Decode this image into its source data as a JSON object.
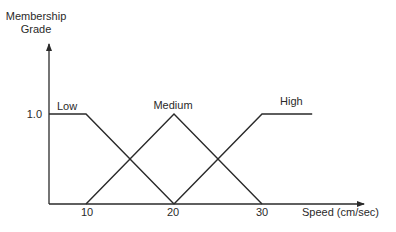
{
  "chart_data": {
    "type": "line",
    "title": "",
    "ylabel_line1": "Membership",
    "ylabel_line2": "Grade",
    "xlabel": "Speed (cm/sec)",
    "ytick_labels": [
      "1.0"
    ],
    "xtick_labels": [
      "10",
      "20",
      "30"
    ],
    "xticks": [
      10,
      20,
      30
    ],
    "yticks": [
      1.0
    ],
    "ylim": [
      0,
      1.5
    ],
    "xlim": [
      4,
      37
    ],
    "grid": false,
    "legend": "inline labels",
    "series": [
      {
        "name": "Low",
        "x": [
          5.8,
          10,
          20
        ],
        "y": [
          1,
          1,
          0
        ]
      },
      {
        "name": "Medium",
        "x": [
          10,
          20,
          30
        ],
        "y": [
          0,
          1,
          0
        ]
      },
      {
        "name": "High",
        "x": [
          20,
          30,
          35.7
        ],
        "y": [
          0,
          1,
          1
        ]
      }
    ],
    "line_color": "#2a2a2a"
  }
}
